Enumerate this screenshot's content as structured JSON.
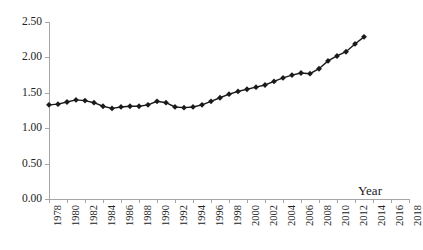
{
  "chart_data": {
    "type": "line",
    "title": "",
    "xlabel": "Year",
    "ylabel": "",
    "grid": false,
    "legend": "none",
    "marker": "diamond",
    "line_color": "#1a1a1a",
    "marker_color": "#1a1a1a",
    "axis_color": "#a6a6a6",
    "ylim": [
      0.0,
      2.5
    ],
    "ytick_labels": [
      "0.00",
      "0.50",
      "1.00",
      "1.50",
      "2.00",
      "2.50"
    ],
    "ytick_values": [
      0.0,
      0.5,
      1.0,
      1.5,
      2.0,
      2.5
    ],
    "xlim": [
      1978,
      2018
    ],
    "xtick_labels": [
      "1978",
      "1980",
      "1982",
      "1984",
      "1986",
      "1988",
      "1990",
      "1992",
      "1994",
      "1996",
      "1998",
      "2000",
      "2002",
      "2004",
      "2006",
      "2008",
      "2010",
      "2012",
      "2014",
      "2016",
      "2018"
    ],
    "xtick_values": [
      1978,
      1980,
      1982,
      1984,
      1986,
      1988,
      1990,
      1992,
      1994,
      1996,
      1998,
      2000,
      2002,
      2004,
      2006,
      2008,
      2010,
      2012,
      2014,
      2016,
      2018
    ],
    "x": [
      1978,
      1979,
      1980,
      1981,
      1982,
      1983,
      1984,
      1985,
      1986,
      1987,
      1988,
      1989,
      1990,
      1991,
      1992,
      1993,
      1994,
      1995,
      1996,
      1997,
      1998,
      1999,
      2000,
      2001,
      2002,
      2003,
      2004,
      2005,
      2006,
      2007,
      2008,
      2009,
      2010,
      2011,
      2012,
      2013
    ],
    "values": [
      1.33,
      1.34,
      1.37,
      1.4,
      1.39,
      1.36,
      1.31,
      1.28,
      1.3,
      1.31,
      1.31,
      1.33,
      1.38,
      1.36,
      1.3,
      1.29,
      1.3,
      1.33,
      1.38,
      1.43,
      1.48,
      1.52,
      1.55,
      1.58,
      1.61,
      1.66,
      1.71,
      1.75,
      1.78,
      1.77,
      1.84,
      1.95,
      2.02,
      2.08,
      2.19,
      2.29
    ]
  }
}
